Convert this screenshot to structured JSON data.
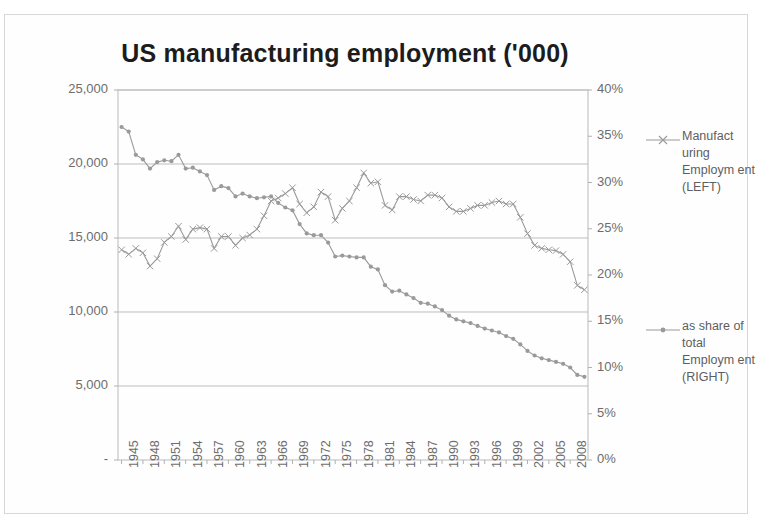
{
  "chart_data": {
    "type": "line",
    "title": "US  manufacturing employment ('000)",
    "xlabel": "",
    "ylabel": "",
    "grid": true,
    "legend_position": "right",
    "x": [
      1945,
      1946,
      1947,
      1948,
      1949,
      1950,
      1951,
      1952,
      1953,
      1954,
      1955,
      1956,
      1957,
      1958,
      1959,
      1960,
      1961,
      1962,
      1963,
      1964,
      1965,
      1966,
      1967,
      1968,
      1969,
      1970,
      1971,
      1972,
      1973,
      1974,
      1975,
      1976,
      1977,
      1978,
      1979,
      1980,
      1981,
      1982,
      1983,
      1984,
      1985,
      1986,
      1987,
      1988,
      1989,
      1990,
      1991,
      1992,
      1993,
      1994,
      1995,
      1996,
      1997,
      1998,
      1999,
      2000,
      2001,
      2002,
      2003,
      2004,
      2005,
      2006,
      2007,
      2008,
      2009,
      2010
    ],
    "xtick_labels": [
      "1945",
      "1948",
      "1951",
      "1954",
      "1957",
      "1960",
      "1963",
      "1966",
      "1969",
      "1972",
      "1975",
      "1978",
      "1981",
      "1984",
      "1987",
      "1990",
      "1993",
      "1996",
      "1999",
      "2002",
      "2005",
      "2008"
    ],
    "xtick_step": 3,
    "yaxis_left": {
      "label": "",
      "ticks": [
        "-",
        "5,000",
        "10,000",
        "15,000",
        "20,000",
        "25,000"
      ],
      "tick_values": [
        0,
        5000,
        10000,
        15000,
        20000,
        25000
      ],
      "min": 0,
      "max": 25000
    },
    "yaxis_right": {
      "label": "",
      "ticks": [
        "0%",
        "5%",
        "10%",
        "15%",
        "20%",
        "25%",
        "30%",
        "35%",
        "40%"
      ],
      "tick_values": [
        0,
        5,
        10,
        15,
        20,
        25,
        30,
        35,
        40
      ],
      "min": 0,
      "max": 40
    },
    "series": [
      {
        "name": "Manufacturing Employment (LEFT)",
        "axis": "left",
        "marker": "x",
        "color": "#9a9a9a",
        "values": [
          14200,
          13900,
          14300,
          14000,
          13100,
          13600,
          14700,
          15100,
          15800,
          14900,
          15600,
          15700,
          15600,
          14300,
          15100,
          15100,
          14500,
          15000,
          15200,
          15600,
          16500,
          17500,
          17700,
          18000,
          18400,
          17300,
          16700,
          17100,
          18100,
          17800,
          16200,
          17000,
          17500,
          18400,
          19400,
          18700,
          18800,
          17200,
          16900,
          17800,
          17800,
          17600,
          17500,
          17900,
          17900,
          17700,
          17100,
          16800,
          16800,
          17000,
          17200,
          17200,
          17400,
          17500,
          17300,
          17300,
          16400,
          15300,
          14500,
          14300,
          14200,
          14150,
          13900,
          13400,
          11800,
          11500
        ]
      },
      {
        "name": "as share of total Employment (RIGHT)",
        "axis": "right",
        "marker": "dot",
        "color": "#9a9a9a",
        "values": [
          36.0,
          35.5,
          33.0,
          32.5,
          31.5,
          32.2,
          32.4,
          32.3,
          33.0,
          31.5,
          31.6,
          31.2,
          30.8,
          29.2,
          29.6,
          29.4,
          28.5,
          28.8,
          28.5,
          28.3,
          28.4,
          28.5,
          27.8,
          27.3,
          27.0,
          25.5,
          24.5,
          24.3,
          24.3,
          23.5,
          22.0,
          22.1,
          22.0,
          21.9,
          21.9,
          20.9,
          20.6,
          18.9,
          18.2,
          18.3,
          17.9,
          17.5,
          17.0,
          16.9,
          16.6,
          16.2,
          15.6,
          15.2,
          15.0,
          14.8,
          14.5,
          14.2,
          14.0,
          13.8,
          13.4,
          13.1,
          12.5,
          11.8,
          11.3,
          11.0,
          10.8,
          10.6,
          10.4,
          10.0,
          9.2,
          9.0
        ]
      }
    ]
  },
  "legend": {
    "entries": [
      {
        "label": "Manufact uring Employm ent (LEFT)",
        "marker": "x-marker-line"
      },
      {
        "label": "as share of total Employm ent (RIGHT)",
        "marker": "dot-marker-line"
      }
    ]
  }
}
